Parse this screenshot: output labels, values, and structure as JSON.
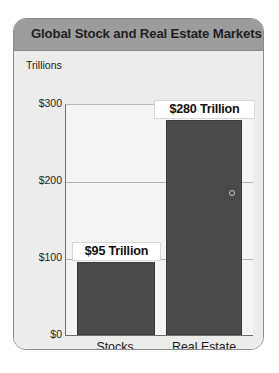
{
  "card": {
    "title": "Global Stock and Real Estate Markets"
  },
  "chart_data": {
    "type": "bar",
    "title": "Global Stock and Real Estate Markets",
    "xlabel": "",
    "ylabel": "Trillions",
    "categories": [
      "Stocks",
      "Real Estate"
    ],
    "values": [
      95,
      280
    ],
    "value_labels": [
      "$95 Trillion",
      "$280 Trillion"
    ],
    "ytick_labels": [
      "$300",
      "$200",
      "$100",
      "$0"
    ],
    "ytick_values": [
      300,
      200,
      100,
      0
    ],
    "ylim": [
      0,
      300
    ],
    "grid": true,
    "legend": "none",
    "bar_color": "#4a4a4a",
    "units": "Trillions of US dollars"
  }
}
